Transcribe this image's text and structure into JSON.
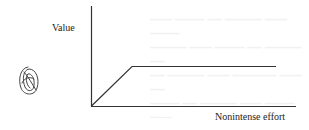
{
  "diagram": {
    "y_axis_label": "Value",
    "x_axis_label": "Nonintense effort",
    "curve": {
      "type": "ramp-then-plateau",
      "points": [
        [
          0,
          0
        ],
        [
          1,
          1
        ],
        [
          3.5,
          1
        ]
      ]
    },
    "icon": "spiral-scribble-icon",
    "colors": {
      "line": "#333333",
      "text": "#222222",
      "background": "#ffffff"
    }
  }
}
